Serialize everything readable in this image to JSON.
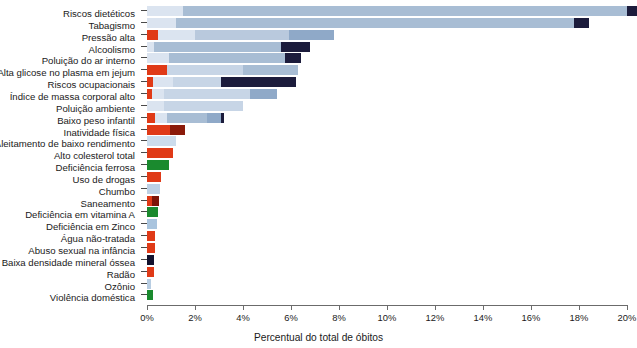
{
  "chart_data": {
    "type": "bar",
    "orientation": "horizontal",
    "stacked": true,
    "title": "",
    "xlabel": "Percentual do total de óbitos",
    "ylabel": "",
    "xlim": [
      0,
      20.6
    ],
    "xticks": [
      0,
      2,
      4,
      6,
      8,
      10,
      12,
      14,
      16,
      18,
      20
    ],
    "xtick_labels": [
      "0%",
      "2%",
      "4%",
      "6%",
      "8%",
      "10%",
      "12%",
      "14%",
      "16%",
      "18%",
      "20%"
    ],
    "grid": false,
    "legend": "none",
    "unit": "percent",
    "categories": [
      "Riscos dietéticos",
      "Tabagismo",
      "Pressão alta",
      "Alcoolismo",
      "Poluição do ar interno",
      "Alta glicose no plasma em jejum",
      "Riscos ocupacionais",
      "Índice de massa corporal alto",
      "Poluição ambiente",
      "Baixo peso infantil",
      "Inatividade física",
      "Aleitamento de baixo rendimento",
      "Alto colesterol total",
      "Deficiência ferrosa",
      "Uso de drogas",
      "Chumbo",
      "Saneamento",
      "Deficiência em vitamina A",
      "Deficiência em Zinco",
      "Água não-tratada",
      "Abuso sexual na infância",
      "Baixa densidade mineral óssea",
      "Radão",
      "Ozônio",
      "Violência doméstica"
    ],
    "values": [
      20.4,
      18.4,
      7.8,
      6.8,
      6.4,
      6.3,
      6.2,
      5.4,
      4.0,
      3.2,
      1.6,
      1.2,
      1.1,
      0.9,
      0.6,
      0.55,
      0.5,
      0.45,
      0.4,
      0.35,
      0.35,
      0.3,
      0.3,
      0.15,
      0.25
    ],
    "colors": {
      "light_blue": "#dbe4f0",
      "pale_blue": "#c7d5e6",
      "mid_blue": "#a8bdd4",
      "steel_blue": "#8fa9c8",
      "navy": "#1c1c3c",
      "red": "#e03a17",
      "dark_red": "#8b1a0a",
      "green": "#1a8a2e"
    },
    "bars": [
      {
        "category": "Riscos dietéticos",
        "total": 20.4,
        "segments": [
          {
            "start": 0.0,
            "end": 1.5,
            "color": "#dbe4f0"
          },
          {
            "start": 1.5,
            "end": 20.0,
            "color": "#a8bdd4"
          },
          {
            "start": 20.0,
            "end": 20.4,
            "color": "#1c1c3c"
          }
        ]
      },
      {
        "category": "Tabagismo",
        "total": 18.4,
        "segments": [
          {
            "start": 0.0,
            "end": 1.2,
            "color": "#dbe4f0"
          },
          {
            "start": 1.2,
            "end": 17.8,
            "color": "#a8bdd4"
          },
          {
            "start": 17.8,
            "end": 18.4,
            "color": "#1c1c3c"
          }
        ]
      },
      {
        "category": "Pressão alta",
        "total": 7.8,
        "segments": [
          {
            "start": 0.0,
            "end": 0.45,
            "color": "#e03a17"
          },
          {
            "start": 0.45,
            "end": 2.0,
            "color": "#dbe4f0"
          },
          {
            "start": 2.0,
            "end": 5.9,
            "color": "#b9c9dd"
          },
          {
            "start": 5.9,
            "end": 7.8,
            "color": "#8fa9c8"
          }
        ]
      },
      {
        "category": "Alcoolismo",
        "total": 6.8,
        "segments": [
          {
            "start": 0.0,
            "end": 0.3,
            "color": "#dbe4f0"
          },
          {
            "start": 0.3,
            "end": 5.6,
            "color": "#a8bdd4"
          },
          {
            "start": 5.6,
            "end": 6.8,
            "color": "#1c1c3c"
          }
        ]
      },
      {
        "category": "Poluição do ar interno",
        "total": 6.4,
        "segments": [
          {
            "start": 0.0,
            "end": 0.9,
            "color": "#dbe4f0"
          },
          {
            "start": 0.9,
            "end": 5.75,
            "color": "#a8bdd4"
          },
          {
            "start": 5.75,
            "end": 6.4,
            "color": "#1c1c3c"
          }
        ]
      },
      {
        "category": "Alta glicose no plasma em jejum",
        "total": 6.3,
        "segments": [
          {
            "start": 0.0,
            "end": 0.85,
            "color": "#e03a17"
          },
          {
            "start": 0.85,
            "end": 4.0,
            "color": "#c7d5e6"
          },
          {
            "start": 4.0,
            "end": 6.3,
            "color": "#a8bdd4"
          }
        ]
      },
      {
        "category": "Riscos ocupacionais",
        "total": 6.2,
        "segments": [
          {
            "start": 0.0,
            "end": 0.25,
            "color": "#e03a17"
          },
          {
            "start": 0.25,
            "end": 1.1,
            "color": "#dbe4f0"
          },
          {
            "start": 1.1,
            "end": 3.1,
            "color": "#c7d5e6"
          },
          {
            "start": 3.1,
            "end": 6.2,
            "color": "#1c1c3c"
          }
        ]
      },
      {
        "category": "Índice de massa corporal alto",
        "total": 5.4,
        "segments": [
          {
            "start": 0.0,
            "end": 0.2,
            "color": "#e03a17"
          },
          {
            "start": 0.2,
            "end": 0.7,
            "color": "#dbe4f0"
          },
          {
            "start": 0.7,
            "end": 4.3,
            "color": "#c7d5e6"
          },
          {
            "start": 4.3,
            "end": 5.4,
            "color": "#8fa9c8"
          }
        ]
      },
      {
        "category": "Poluição ambiente",
        "total": 4.0,
        "segments": [
          {
            "start": 0.0,
            "end": 0.7,
            "color": "#dbe4f0"
          },
          {
            "start": 0.7,
            "end": 4.0,
            "color": "#c7d5e6"
          }
        ]
      },
      {
        "category": "Baixo peso infantil",
        "total": 3.2,
        "segments": [
          {
            "start": 0.0,
            "end": 0.35,
            "color": "#e03a17"
          },
          {
            "start": 0.35,
            "end": 0.85,
            "color": "#dbe4f0"
          },
          {
            "start": 0.85,
            "end": 2.5,
            "color": "#a8bdd4"
          },
          {
            "start": 2.5,
            "end": 3.1,
            "color": "#8fa9c8"
          },
          {
            "start": 3.1,
            "end": 3.2,
            "color": "#1c1c3c"
          }
        ]
      },
      {
        "category": "Inatividade física",
        "total": 1.6,
        "segments": [
          {
            "start": 0.0,
            "end": 0.95,
            "color": "#e03a17"
          },
          {
            "start": 0.95,
            "end": 1.6,
            "color": "#8b1a0a"
          }
        ]
      },
      {
        "category": "Aleitamento de baixo rendimento",
        "total": 1.2,
        "segments": [
          {
            "start": 0.0,
            "end": 1.2,
            "color": "#ccdcec"
          }
        ]
      },
      {
        "category": "Alto colesterol total",
        "total": 1.1,
        "segments": [
          {
            "start": 0.0,
            "end": 1.1,
            "color": "#e03a17"
          }
        ]
      },
      {
        "category": "Deficiência ferrosa",
        "total": 0.9,
        "segments": [
          {
            "start": 0.0,
            "end": 0.9,
            "color": "#1a8a2e"
          }
        ]
      },
      {
        "category": "Uso de drogas",
        "total": 0.6,
        "segments": [
          {
            "start": 0.0,
            "end": 0.6,
            "color": "#e03a17"
          }
        ]
      },
      {
        "category": "Chumbo",
        "total": 0.55,
        "segments": [
          {
            "start": 0.0,
            "end": 0.55,
            "color": "#bdd0e4"
          }
        ]
      },
      {
        "category": "Saneamento",
        "total": 0.5,
        "segments": [
          {
            "start": 0.0,
            "end": 0.2,
            "color": "#e03a17"
          },
          {
            "start": 0.2,
            "end": 0.5,
            "color": "#7d1408"
          }
        ]
      },
      {
        "category": "Deficiência em vitamina A",
        "total": 0.45,
        "segments": [
          {
            "start": 0.0,
            "end": 0.45,
            "color": "#1a8a2e"
          }
        ]
      },
      {
        "category": "Deficiência em Zinco",
        "total": 0.4,
        "segments": [
          {
            "start": 0.0,
            "end": 0.4,
            "color": "#a9c4de"
          }
        ]
      },
      {
        "category": "Água não-tratada",
        "total": 0.35,
        "segments": [
          {
            "start": 0.0,
            "end": 0.35,
            "color": "#e03a17"
          }
        ]
      },
      {
        "category": "Abuso sexual na infância",
        "total": 0.35,
        "segments": [
          {
            "start": 0.0,
            "end": 0.35,
            "color": "#e03a17"
          }
        ]
      },
      {
        "category": "Baixa densidade mineral óssea",
        "total": 0.3,
        "segments": [
          {
            "start": 0.0,
            "end": 0.3,
            "color": "#12122e"
          }
        ]
      },
      {
        "category": "Radão",
        "total": 0.3,
        "segments": [
          {
            "start": 0.0,
            "end": 0.3,
            "color": "#e03a17"
          }
        ]
      },
      {
        "category": "Ozônio",
        "total": 0.15,
        "segments": [
          {
            "start": 0.0,
            "end": 0.15,
            "color": "#b8cde2"
          }
        ]
      },
      {
        "category": "Violência doméstica",
        "total": 0.25,
        "segments": [
          {
            "start": 0.0,
            "end": 0.25,
            "color": "#1a8a2e"
          }
        ]
      }
    ]
  }
}
